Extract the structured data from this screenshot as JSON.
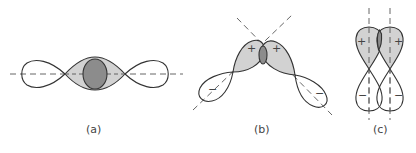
{
  "figure": {
    "panels": [
      {
        "id": "a",
        "label": "(a)",
        "description": "sigma bond from end-on overlap of two p orbitals along a common axis"
      },
      {
        "id": "b",
        "label": "(b)",
        "description": "partial overlap of p orbitals with tilted axes",
        "signs": [
          "+",
          "+",
          "−",
          "−"
        ]
      },
      {
        "id": "c",
        "label": "(c)",
        "description": "pi bond from side-by-side overlap of parallel p orbitals",
        "signs": [
          "+",
          "+",
          "−",
          "−"
        ]
      }
    ],
    "colors": {
      "lobe_shaded": "#d2d2d2",
      "overlap_region": "#8c8c8c",
      "outline": "#333333"
    }
  }
}
